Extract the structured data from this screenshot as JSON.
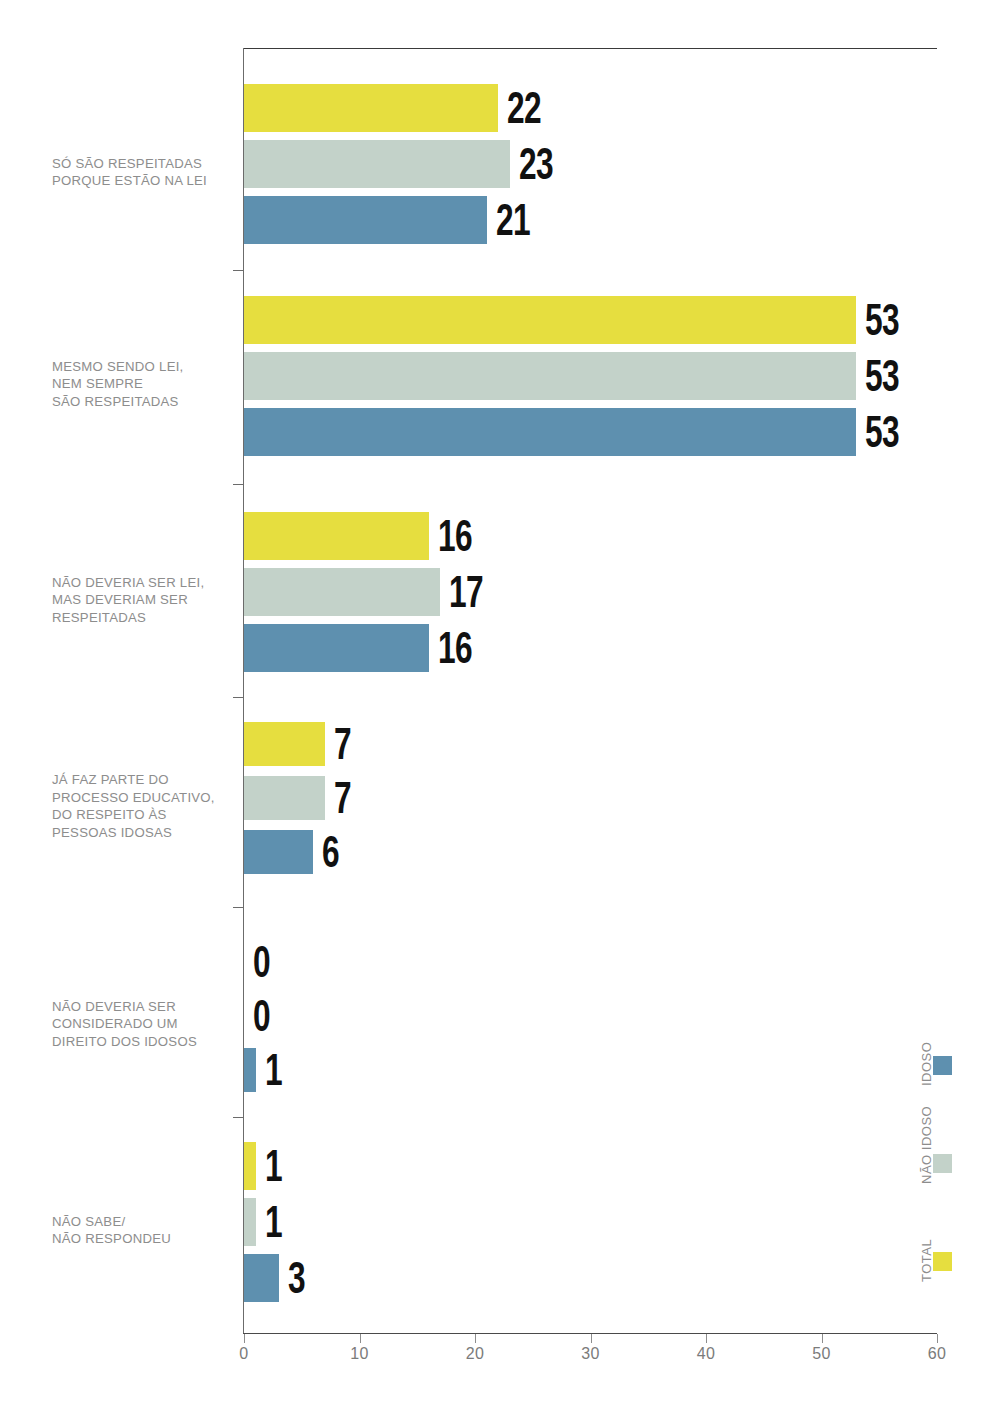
{
  "chart_data": {
    "type": "bar",
    "orientation": "horizontal",
    "title": "",
    "subtitle": "",
    "xlabel": "",
    "ylabel": "",
    "xlim": [
      0,
      60
    ],
    "xticks": [
      0,
      10,
      20,
      30,
      40,
      50,
      60
    ],
    "xtick_labels": [
      "0",
      "10",
      "20",
      "30",
      "40",
      "50",
      "60"
    ],
    "grid": false,
    "legend_position": "right-vertical",
    "categories": [
      "SÓ SÃO RESPEITADAS\nPORQUE ESTÃO NA LEI",
      "MESMO SENDO LEI,\nNEM SEMPRE\nSÃO RESPEITADAS",
      "NÃO DEVERIA SER LEI,\nMAS DEVERIAM SER\nRESPEITADAS",
      "JÁ FAZ PARTE DO\nPROCESSO EDUCATIVO,\nDO RESPEITO ÀS\nPESSOAS IDOSAS",
      "NÃO DEVERIA SER\nCONSIDERADO UM\nDIREITO DOS IDOSOS",
      "NÃO SABE/\nNÃO RESPONDEU"
    ],
    "series": [
      {
        "name": "TOTAL",
        "color": "#e6de3f",
        "values": [
          22,
          53,
          16,
          7,
          0,
          1
        ]
      },
      {
        "name": "NÃO IDOSO",
        "color": "#c3d2c9",
        "values": [
          23,
          53,
          17,
          7,
          0,
          1
        ]
      },
      {
        "name": "IDOSO",
        "color": "#5e90af",
        "values": [
          21,
          53,
          16,
          6,
          1,
          3
        ]
      }
    ],
    "value_labels": [
      [
        "22",
        "23",
        "21"
      ],
      [
        "53",
        "53",
        "53"
      ],
      [
        "16",
        "17",
        "16"
      ],
      [
        "7",
        "7",
        "6"
      ],
      [
        "0",
        "0",
        "1"
      ],
      [
        "1",
        "1",
        "3"
      ]
    ]
  },
  "legend": {
    "items": [
      {
        "label": "IDOSO",
        "color": "#5e90af"
      },
      {
        "label": "NÃO IDOSO",
        "color": "#c3d2c9"
      },
      {
        "label": "TOTAL",
        "color": "#e6de3f"
      }
    ]
  },
  "colors": {
    "total": "#e6de3f",
    "nao_idoso": "#c3d2c9",
    "idoso": "#5e90af",
    "axis": "#6b6b6b",
    "label_text": "#8d8d8d",
    "value_text": "#111111",
    "background": "#ffffff"
  }
}
